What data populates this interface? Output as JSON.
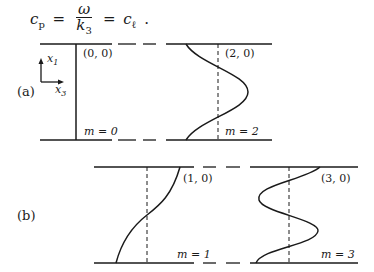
{
  "equation": {
    "lhs": "c",
    "lhs_sub": "p",
    "num": "ω",
    "den": "k",
    "den_sub": "3",
    "rhs": "c",
    "rhs_sub": "ℓ",
    "eq": "=",
    "period": "."
  },
  "figure": {
    "axes": {
      "x1": "x",
      "x1_sub": "1",
      "x3": "x",
      "x3_sub": "3"
    },
    "part_a": {
      "label": "(a)",
      "modes": [
        {
          "index_label": "(0, 0)",
          "m_label": "m = 0"
        },
        {
          "index_label": "(2, 0)",
          "m_label": "m = 2"
        }
      ]
    },
    "part_b": {
      "label": "(b)",
      "modes": [
        {
          "index_label": "(1, 0)",
          "m_label": "m = 1"
        },
        {
          "index_label": "(3, 0)",
          "m_label": "m = 3"
        }
      ]
    }
  }
}
